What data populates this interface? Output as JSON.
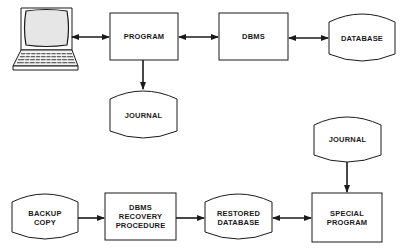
{
  "diagram": {
    "colors": {
      "stroke": "#1a1a1a",
      "fill": "#ffffff",
      "screen": "#e8e8e8"
    },
    "top_row": {
      "terminal": {
        "icon": "laptop-terminal-icon"
      },
      "program": {
        "label": "PROGRAM",
        "shape": "rectangle"
      },
      "dbms": {
        "label": "DBMS",
        "shape": "rectangle"
      },
      "database": {
        "label": "DATABASE",
        "shape": "cylinder"
      },
      "journal": {
        "label": "JOURNAL",
        "shape": "cylinder"
      }
    },
    "bottom_row": {
      "journal": {
        "label": "JOURNAL",
        "shape": "cylinder"
      },
      "backup_copy": {
        "line1": "BACKUP",
        "line2": "COPY",
        "shape": "cylinder"
      },
      "recovery": {
        "line1": "DBMS",
        "line2": "RECOVERY",
        "line3": "PROCEDURE",
        "shape": "rectangle"
      },
      "restored_db": {
        "line1": "RESTORED",
        "line2": "DATABASE",
        "shape": "cylinder"
      },
      "special_program": {
        "line1": "SPECIAL",
        "line2": "PROGRAM",
        "shape": "rectangle"
      }
    },
    "connections": [
      {
        "from": "terminal",
        "to": "program",
        "type": "bidirectional"
      },
      {
        "from": "program",
        "to": "dbms",
        "type": "bidirectional"
      },
      {
        "from": "dbms",
        "to": "database",
        "type": "bidirectional"
      },
      {
        "from": "program",
        "to": "journal",
        "type": "directed"
      },
      {
        "from": "journal_2",
        "to": "special_program",
        "type": "directed"
      },
      {
        "from": "backup_copy",
        "to": "recovery",
        "type": "directed"
      },
      {
        "from": "recovery",
        "to": "restored_db",
        "type": "directed"
      },
      {
        "from": "restored_db",
        "to": "special_program",
        "type": "bidirectional"
      }
    ]
  }
}
